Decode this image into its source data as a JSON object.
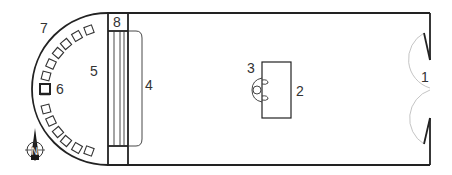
{
  "diagram": {
    "type": "floor-plan",
    "labels": {
      "entrance": "1",
      "table": "2",
      "chair": "3",
      "stage": "4",
      "apse_area": "5",
      "throne": "6",
      "apse_seating": "7",
      "stage_end": "8"
    },
    "compass": {
      "letter": "N"
    },
    "colors": {
      "line": "#222222",
      "door_arc": "#b5b5b5",
      "background": "#ffffff"
    }
  }
}
